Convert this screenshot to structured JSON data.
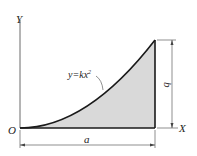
{
  "diagram": {
    "axis_y_label": "Y",
    "axis_x_label": "X",
    "origin_label": "O",
    "curve_label": "y=kx",
    "curve_exponent": "2",
    "width_dim_label": "a",
    "height_dim_label": "b",
    "colors": {
      "fill": "#d9d9d9",
      "stroke": "#1a1a1a",
      "thin": "#444444"
    }
  }
}
